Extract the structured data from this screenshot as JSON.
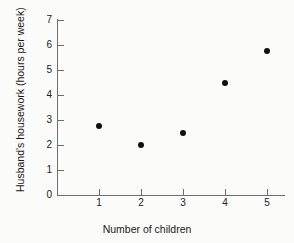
{
  "chart_data": {
    "type": "scatter",
    "title": "",
    "xlabel": "Number of children",
    "ylabel": "Husband's housework (hours per week)",
    "x": [
      1,
      2,
      3,
      4,
      5
    ],
    "values": [
      2.75,
      2.0,
      2.5,
      4.5,
      5.75
    ],
    "series": [
      {
        "name": "Husband's housework",
        "points": [
          {
            "x": 1,
            "y": 2.75
          },
          {
            "x": 2,
            "y": 2.0
          },
          {
            "x": 3,
            "y": 2.5
          },
          {
            "x": 4,
            "y": 4.5
          },
          {
            "x": 5,
            "y": 5.75
          }
        ]
      }
    ],
    "xlim": [
      0,
      5.45
    ],
    "ylim": [
      0,
      7
    ],
    "x_ticks": [
      "1",
      "2",
      "3",
      "4",
      "5"
    ],
    "y_ticks": [
      "0",
      "1",
      "2",
      "3",
      "4",
      "5",
      "6",
      "7"
    ],
    "grid": false,
    "legend": false,
    "marker_color": "#101010",
    "axis_color": "#6e6e6e",
    "background_color": "#fbfbf9"
  }
}
